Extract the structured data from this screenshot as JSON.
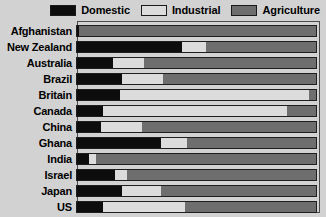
{
  "legend": {
    "entries": [
      {
        "label": "Domestic",
        "key": "domestic",
        "color": "#0d0d0d"
      },
      {
        "label": "Industrial",
        "key": "industrial",
        "color": "#dcdcdc"
      },
      {
        "label": "Agriculture",
        "key": "agriculture",
        "color": "#6e6e6e"
      }
    ]
  },
  "chart_data": {
    "type": "bar",
    "orientation": "horizontal",
    "stacked": true,
    "normalized_percent": true,
    "title": "",
    "subtitle": "",
    "xlabel": "",
    "ylabel": "",
    "xlim": [
      0,
      100
    ],
    "grid": false,
    "legend_position": "top-right",
    "categories": [
      "Afghanistan",
      "New Zealand",
      "Australia",
      "Brazil",
      "Britain",
      "Canada",
      "China",
      "Ghana",
      "India",
      "Israel",
      "Japan",
      "US"
    ],
    "series": [
      {
        "name": "Domestic",
        "color": "#0d0d0d",
        "values": [
          1,
          44,
          15,
          19,
          18,
          11,
          10,
          35,
          5,
          16,
          19,
          11
        ]
      },
      {
        "name": "Industrial",
        "color": "#dcdcdc",
        "values": [
          0,
          10,
          13,
          17,
          79,
          77,
          17,
          11,
          3,
          5,
          16,
          34
        ]
      },
      {
        "name": "Agriculture",
        "color": "#6e6e6e",
        "values": [
          99,
          46,
          72,
          64,
          3,
          12,
          73,
          54,
          92,
          79,
          65,
          55
        ]
      }
    ],
    "annotations": []
  }
}
